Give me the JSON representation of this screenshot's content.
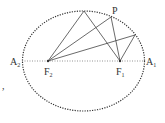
{
  "diagram": {
    "type": "ellipse-foci",
    "ellipse": {
      "cx": 83.5,
      "cy": 61,
      "rx": 61,
      "ry": 50,
      "stroke": "#333333",
      "dash": "dotted"
    },
    "axis": {
      "x1": 22,
      "x2": 145,
      "y": 61,
      "dash": "dotted"
    },
    "points": {
      "F2": {
        "x": 48,
        "y": 61
      },
      "F1": {
        "x": 120,
        "y": 61
      },
      "T": {
        "x": 84,
        "y": 11
      },
      "P": {
        "x": 111,
        "y": 17
      },
      "R": {
        "x": 135,
        "y": 35
      }
    },
    "labels": {
      "A2": {
        "main": "A",
        "sub": "2"
      },
      "A1": {
        "main": "A",
        "sub": "1"
      },
      "F2": {
        "main": "F",
        "sub": "2"
      },
      "F1": {
        "main": "F",
        "sub": "1"
      },
      "P": {
        "main": "P"
      }
    },
    "stray_mark": ","
  }
}
